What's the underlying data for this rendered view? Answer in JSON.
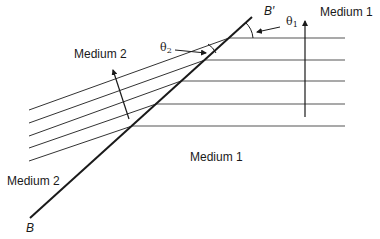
{
  "diagram": {
    "type": "refraction-of-plane-wave-at-interface",
    "labels": {
      "medium1_top": "Medium 1",
      "medium1_bottom": "Medium 1",
      "medium2_upper": "Medium 2",
      "medium2_lower": "Medium 2",
      "boundary_end_top": "B′",
      "boundary_end_bottom": "B",
      "theta1": "θ",
      "theta1_sub": "1",
      "theta2": "θ",
      "theta2_sub": "2"
    },
    "colors": {
      "line": "#1a1a1a",
      "wavefront": "#555555",
      "background": "#ffffff"
    },
    "interface": {
      "x1": 30,
      "y1": 218,
      "x2": 252,
      "y2": 17
    },
    "medium1_wavefronts": [
      {
        "x1": 229,
        "y1": 38,
        "x2": 345,
        "y2": 38
      },
      {
        "x1": 205,
        "y1": 60,
        "x2": 345,
        "y2": 60
      },
      {
        "x1": 181,
        "y1": 81,
        "x2": 345,
        "y2": 81
      },
      {
        "x1": 156,
        "y1": 104,
        "x2": 345,
        "y2": 104
      },
      {
        "x1": 132,
        "y1": 126,
        "x2": 345,
        "y2": 126
      }
    ],
    "medium2_wavefronts": [
      {
        "x1": 29,
        "y1": 110,
        "x2": 229,
        "y2": 38
      },
      {
        "x1": 29,
        "y1": 123,
        "x2": 205,
        "y2": 60
      },
      {
        "x1": 29,
        "y1": 136,
        "x2": 181,
        "y2": 81
      },
      {
        "x1": 29,
        "y1": 148,
        "x2": 156,
        "y2": 104
      },
      {
        "x1": 29,
        "y1": 161,
        "x2": 132,
        "y2": 126
      }
    ],
    "medium1_propagation_arrow": {
      "x1": 305,
      "y1": 117,
      "x2": 305,
      "y2": 20
    },
    "medium2_propagation_arrow": {
      "x1": 129,
      "y1": 119,
      "x2": 113,
      "y2": 69
    }
  }
}
